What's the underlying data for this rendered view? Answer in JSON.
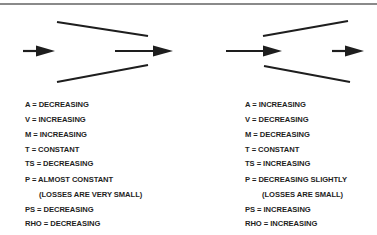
{
  "figure": {
    "left_panel": {
      "name": "converging-duct",
      "properties": [
        {
          "label": "A = DECREASING",
          "indent": false
        },
        {
          "label": "V = INCREASING",
          "indent": false
        },
        {
          "label": "M = INCREASING",
          "indent": false
        },
        {
          "label": "T = CONSTANT",
          "indent": false
        },
        {
          "label": "TS = DECREASING",
          "indent": false
        },
        {
          "label": "P = ALMOST CONSTANT",
          "indent": false
        },
        {
          "label": "(LOSSES ARE VERY SMALL)",
          "indent": true
        },
        {
          "label": "PS = DECREASING",
          "indent": false
        },
        {
          "label": "RHO = DECREASING",
          "indent": false
        }
      ]
    },
    "right_panel": {
      "name": "diverging-duct",
      "properties": [
        {
          "label": "A = INCREASING",
          "indent": false
        },
        {
          "label": "V = DECREASING",
          "indent": false
        },
        {
          "label": "M = DECREASING",
          "indent": false
        },
        {
          "label": "T = CONSTANT",
          "indent": false
        },
        {
          "label": "TS = INCREASING",
          "indent": false
        },
        {
          "label": "P = DECREASING SLIGHTLY",
          "indent": false
        },
        {
          "label": "(LOSSES ARE SMALL)",
          "indent": true
        },
        {
          "label": "PS = INCREASING",
          "indent": false
        },
        {
          "label": "RHO = INCREASING",
          "indent": false
        }
      ]
    },
    "colors": {
      "stroke": "#1e1e1e",
      "rule": "#8a8a8a"
    }
  }
}
